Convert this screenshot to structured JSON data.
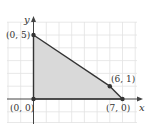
{
  "diagram": {
    "type": "feasible-region-graph",
    "axes": {
      "x_label": "x",
      "y_label": "y"
    },
    "grid": {
      "x_min": -2,
      "x_max": 8,
      "y_min": -2,
      "y_max": 6,
      "step": 1
    },
    "region": {
      "fill_color": "#d9d9d9",
      "edge_color": "#333333",
      "vertices": [
        {
          "x": 0,
          "y": 0,
          "label": "(0, 0)"
        },
        {
          "x": 0,
          "y": 5,
          "label": "(0, 5)"
        },
        {
          "x": 6,
          "y": 1,
          "label": "(6, 1)"
        },
        {
          "x": 7,
          "y": 0,
          "label": "(7, 0)"
        }
      ]
    },
    "labels": {
      "origin": "(0, 0)",
      "top": "(0, 5)",
      "mid": "(6, 1)",
      "right": "(7, 0)"
    },
    "colors": {
      "grid": "#e2e2e2",
      "axis": "#444444",
      "region": "#d9d9d9",
      "point": "#333333"
    }
  }
}
